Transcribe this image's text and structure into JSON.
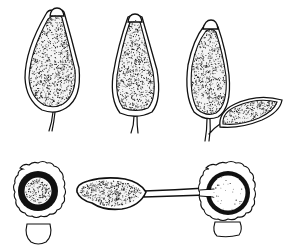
{
  "figure": {
    "background": "#ffffff",
    "ink": "#111111",
    "top_row": [
      {
        "id": "sporangium-1",
        "cx": 52,
        "top": 8,
        "bottom": 113,
        "half_width": 27,
        "stalk_to": [
          50,
          131
        ]
      },
      {
        "id": "sporangium-2",
        "cx": 135,
        "top": 14,
        "bottom": 117,
        "half_width": 24,
        "stalk_to": [
          134,
          134
        ]
      },
      {
        "id": "sporangium-3",
        "cx": 208,
        "top": 20,
        "bottom": 120,
        "half_width": 22,
        "stalk_to": [
          207,
          141
        ]
      },
      {
        "id": "sporangium-3-lateral",
        "from": [
          218,
          126
        ],
        "to": [
          281,
          102
        ],
        "half_width": 11
      }
    ],
    "bottom_row": [
      {
        "id": "encysted-spore-left",
        "cx": 38,
        "cy": 191,
        "outer_r": 26,
        "ring_r": 20,
        "core_r": 13,
        "basal_blob": [
          38,
          233,
          15,
          12
        ]
      },
      {
        "id": "germinating-spore-middle",
        "x1": 75,
        "x2": 146,
        "cy": 194,
        "tube_to": 206
      },
      {
        "id": "encysted-spore-right",
        "cx": 228,
        "cy": 193,
        "outer_r": 29,
        "ring_r": 22,
        "core_r": 18,
        "basal_blob": [
          228,
          229,
          13,
          9
        ]
      }
    ]
  }
}
